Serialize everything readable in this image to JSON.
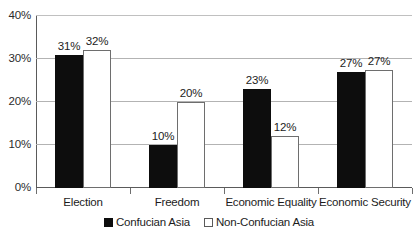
{
  "chart_data": {
    "type": "bar",
    "title": "",
    "xlabel": "",
    "ylabel": "",
    "ylim": [
      0,
      40
    ],
    "yticks": [
      "0%",
      "10%",
      "20%",
      "30%",
      "40%"
    ],
    "ytick_values": [
      0,
      10,
      20,
      30,
      40
    ],
    "grid": true,
    "legend_position": "bottom",
    "categories": [
      "Election",
      "Freedom",
      "Economic Equality",
      "Economic Security"
    ],
    "series": [
      {
        "name": "Confucian Asia",
        "color": "#0d0d0d",
        "values": [
          31,
          10,
          23,
          27
        ],
        "labels": [
          "31%",
          "10%",
          "23%",
          "27%"
        ]
      },
      {
        "name": "Non-Confucian Asia",
        "color": "#ffffff",
        "values": [
          32,
          20,
          12,
          27.5
        ],
        "labels": [
          "32%",
          "20%",
          "12%",
          "27%"
        ]
      }
    ]
  },
  "legend": {
    "items": [
      {
        "label": "Confucian Asia",
        "swatch": "filled-square-icon"
      },
      {
        "label": "Non-Confucian Asia",
        "swatch": "outlined-square-icon"
      }
    ]
  },
  "colors": {
    "series_dark": "#0d0d0d",
    "series_light": "#ffffff",
    "gridline": "#b3b3b3",
    "axis": "#5a5a5a",
    "text": "#1c1c1c"
  }
}
